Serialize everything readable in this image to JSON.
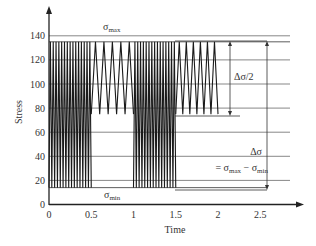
{
  "chart_data": {
    "type": "line",
    "title": "",
    "xlabel": "Time",
    "ylabel": "Stress",
    "xlim": [
      0,
      2.5
    ],
    "ylim": [
      0,
      140
    ],
    "x_ticks": [
      "0",
      "0.5",
      "1",
      "1.5",
      "2",
      "2.5"
    ],
    "y_ticks": [
      "0",
      "20",
      "40",
      "60",
      "80",
      "100",
      "120",
      "140"
    ],
    "grid": "horizontal",
    "series": [
      {
        "name": "stress history",
        "segments": [
          {
            "t_start": 0.0,
            "t_end": 0.5,
            "min": 14,
            "max": 135,
            "cycles": 15
          },
          {
            "t_start": 0.5,
            "t_end": 1.0,
            "min": 75,
            "max": 135,
            "cycles": 5
          },
          {
            "t_start": 1.0,
            "t_end": 1.5,
            "min": 14,
            "max": 135,
            "cycles": 15
          },
          {
            "t_start": 1.5,
            "t_end": 2.0,
            "min": 75,
            "max": 135,
            "cycles": 6
          }
        ]
      }
    ],
    "annotations": {
      "sigma_max": {
        "symbol": "σ",
        "sub": "max",
        "value": 135
      },
      "sigma_min": {
        "symbol": "σ",
        "sub": "min",
        "value": 14
      },
      "half_range": {
        "label": "Δσ/2",
        "from": 135,
        "to": 75
      },
      "range": {
        "label": "Δσ",
        "formula_prefix": "= σ",
        "formula_sub1": "max",
        "formula_mid": " − σ",
        "formula_sub2": "min",
        "from": 135,
        "to": 14
      }
    }
  }
}
